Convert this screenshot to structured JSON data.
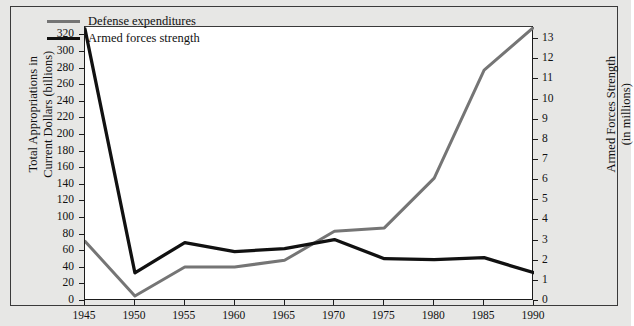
{
  "chart_data": {
    "type": "line",
    "title": "",
    "xlabel": "",
    "x": [
      1945,
      1950,
      1955,
      1960,
      1965,
      1970,
      1975,
      1980,
      1985,
      1990
    ],
    "xticklabels": [
      "1945",
      "1950",
      "1955",
      "1960",
      "1965",
      "1970",
      "1975",
      "1980",
      "1985",
      "1990"
    ],
    "xlim": [
      1945,
      1990
    ],
    "grid": false,
    "legend_position": "top-left",
    "axes": {
      "left": {
        "label": "Total Appropriations in Current Dollars (billions)",
        "label_line1": "Total Appropriations in",
        "label_line2": "Current Dollars (billions)",
        "ylim": [
          0,
          330
        ],
        "tick_step": 20,
        "ticks": [
          0,
          20,
          40,
          60,
          80,
          100,
          120,
          140,
          160,
          180,
          200,
          220,
          240,
          260,
          280,
          300,
          320
        ],
        "ticklabels": [
          "0",
          "20",
          "40",
          "60",
          "80",
          "100",
          "120",
          "140",
          "160",
          "180",
          "200",
          "220",
          "240",
          "260",
          "280",
          "300",
          "320"
        ]
      },
      "right": {
        "label": "Armed Forces Strength (in millions)",
        "label_line1": "Armed Forces Strength",
        "label_line2": "(in millions)",
        "ylim": [
          0,
          13.6
        ],
        "tick_step": 1,
        "ticks": [
          0,
          1,
          2,
          3,
          4,
          5,
          6,
          7,
          8,
          9,
          10,
          11,
          12,
          13
        ],
        "ticklabels": [
          "0",
          "1",
          "2",
          "3",
          "4",
          "5",
          "6",
          "7",
          "8",
          "9",
          "10",
          "11",
          "12",
          "13"
        ]
      }
    },
    "series": [
      {
        "name": "Defense expenditures",
        "axis": "left",
        "color": "#757575",
        "units": "billions of current dollars",
        "values": [
          72,
          6,
          41,
          41,
          49,
          84,
          88,
          148,
          278,
          330
        ]
      },
      {
        "name": "Armed forces strength",
        "axis": "right",
        "color": "#111111",
        "units": "millions",
        "values": [
          13.5,
          1.4,
          2.9,
          2.45,
          2.6,
          3.05,
          2.1,
          2.05,
          2.15,
          1.4
        ]
      }
    ]
  },
  "legend": {
    "items": [
      {
        "label": "Defense expenditures",
        "color": "#757575"
      },
      {
        "label": "Armed forces strength",
        "color": "#111111"
      }
    ]
  },
  "colors": {
    "figure_background": "#e7e7e5",
    "plot_background": "#ffffff",
    "axis": "#1b1b1b",
    "frame": "#3a3a3a",
    "defense_expenditures": "#757575",
    "armed_forces_strength": "#111111"
  }
}
